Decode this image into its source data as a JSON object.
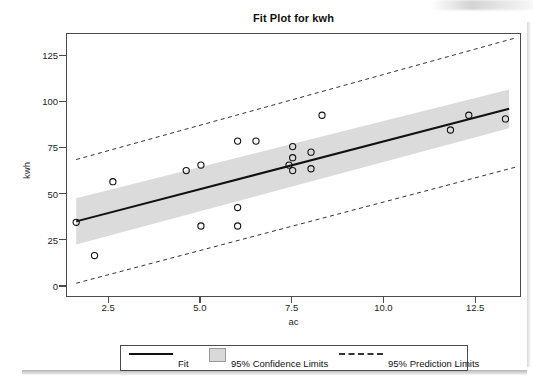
{
  "chart_data": {
    "type": "scatter",
    "title": "Fit Plot for kwh",
    "xlabel": "ac",
    "ylabel": "kwh",
    "xlim": [
      1.35,
      13.75
    ],
    "ylim": [
      -6,
      137
    ],
    "xticks": [
      "2.5",
      "5.0",
      "7.5",
      "10.0",
      "12.5"
    ],
    "xtick_values": [
      2.5,
      5.0,
      7.5,
      10.0,
      12.5
    ],
    "yticks": [
      "0",
      "25",
      "50",
      "75",
      "100",
      "125"
    ],
    "ytick_values": [
      0,
      25,
      50,
      75,
      100,
      125
    ],
    "grid": false,
    "legend_position": "bottom",
    "points": [
      {
        "ac": 1.6,
        "kwh": 35
      },
      {
        "ac": 2.1,
        "kwh": 17
      },
      {
        "ac": 2.6,
        "kwh": 57
      },
      {
        "ac": 4.6,
        "kwh": 63
      },
      {
        "ac": 5.0,
        "kwh": 66
      },
      {
        "ac": 5.0,
        "kwh": 33
      },
      {
        "ac": 6.0,
        "kwh": 79
      },
      {
        "ac": 6.0,
        "kwh": 43
      },
      {
        "ac": 6.0,
        "kwh": 33
      },
      {
        "ac": 6.5,
        "kwh": 79
      },
      {
        "ac": 7.4,
        "kwh": 66
      },
      {
        "ac": 7.5,
        "kwh": 63
      },
      {
        "ac": 7.5,
        "kwh": 76
      },
      {
        "ac": 7.5,
        "kwh": 70
      },
      {
        "ac": 8.0,
        "kwh": 73
      },
      {
        "ac": 8.0,
        "kwh": 64
      },
      {
        "ac": 8.3,
        "kwh": 93
      },
      {
        "ac": 11.8,
        "kwh": 85
      },
      {
        "ac": 12.3,
        "kwh": 93
      },
      {
        "ac": 13.3,
        "kwh": 91
      }
    ],
    "fit_line": {
      "x": [
        1.6,
        13.4
      ],
      "y": [
        35.5,
        96.5
      ]
    },
    "confidence_band": {
      "x": [
        1.6,
        13.4
      ],
      "lower": [
        23.0,
        86.0
      ],
      "upper": [
        48.0,
        107.0
      ]
    },
    "prediction_upper": {
      "x": [
        1.6,
        13.6
      ],
      "y": [
        69.0,
        135.0
      ]
    },
    "prediction_lower": {
      "x": [
        1.6,
        13.6
      ],
      "y": [
        2.0,
        65.0
      ]
    },
    "series": [
      {
        "name": "Fit",
        "style": "solid-line",
        "color": "#111111"
      },
      {
        "name": "95% Confidence Limits",
        "style": "band",
        "color": "#d9d9d9"
      },
      {
        "name": "95% Prediction Limits",
        "style": "dashed-line",
        "color": "#333333"
      }
    ]
  },
  "legend": {
    "fit_label": "Fit",
    "confidence_label": "95% Confidence Limits",
    "prediction_label": "95% Prediction Limits"
  }
}
